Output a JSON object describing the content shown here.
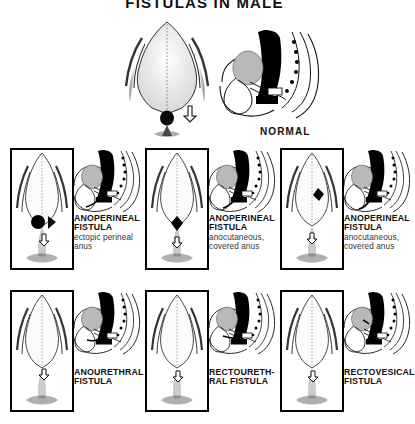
{
  "title": "FISTULAS IN MALE",
  "normal": {
    "label": "NORMAL"
  },
  "cases": [
    {
      "id": "anoperineal-ectopic",
      "heading_line1": "ANOPERINEAL",
      "heading_line2": "FISTULA",
      "sub_line1": "ectopic perineal",
      "sub_line2": "anus",
      "row": 0,
      "col": 0
    },
    {
      "id": "anoperineal-anocutaneous-a",
      "heading_line1": "ANOPERINEAL",
      "heading_line2": "FISTULA",
      "sub_line1": "anocutaneous,",
      "sub_line2": "covered anus",
      "row": 0,
      "col": 1
    },
    {
      "id": "anoperineal-anocutaneous-b",
      "heading_line1": "ANOPERINEAL",
      "heading_line2": "FISTULA",
      "sub_line1": "anocutaneous,",
      "sub_line2": "covered anus",
      "row": 0,
      "col": 2
    },
    {
      "id": "anourethral",
      "heading_line1": "ANOURETHRAL",
      "heading_line2": "FISTULA",
      "sub_line1": "",
      "sub_line2": "",
      "row": 1,
      "col": 0
    },
    {
      "id": "rectourethral",
      "heading_line1": "RECTOURETH-",
      "heading_line2": "RAL FISTULA",
      "sub_line1": "",
      "sub_line2": "",
      "row": 1,
      "col": 1
    },
    {
      "id": "rectovesical",
      "heading_line1": "RECTOVESICAL",
      "heading_line2": "FISTULA",
      "sub_line1": "",
      "sub_line2": "",
      "row": 1,
      "col": 2
    }
  ],
  "colors": {
    "ink": "#000000",
    "rectum_fill": "#000000",
    "bladder_fill": "#b9b9b9",
    "background": "#ffffff",
    "shading": "#555555"
  }
}
